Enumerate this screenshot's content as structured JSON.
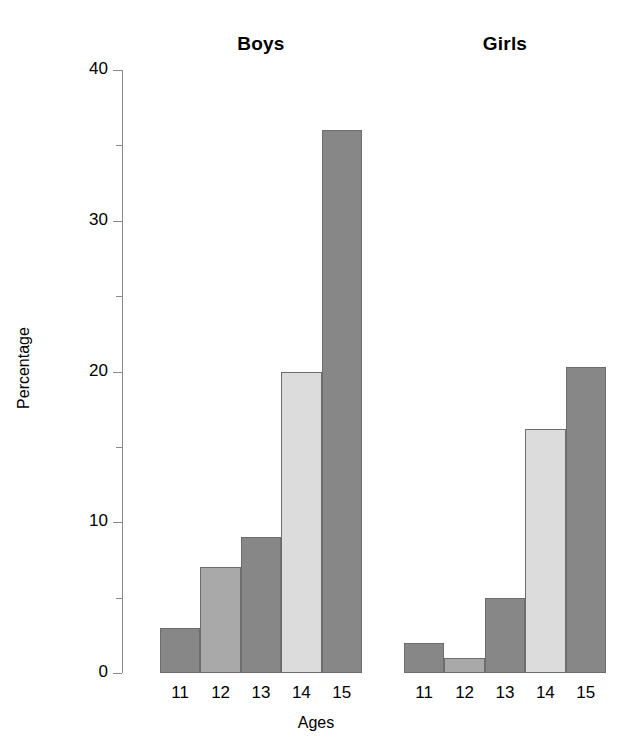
{
  "chart_data": {
    "type": "bar",
    "title": "",
    "xlabel": "Ages",
    "ylabel": "Percentage",
    "ylim": [
      0,
      40
    ],
    "yticks": [
      0,
      10,
      20,
      30,
      40
    ],
    "yticks_minor": [
      5,
      15,
      25,
      35
    ],
    "grid": false,
    "legend": "none",
    "panels": [
      {
        "name": "Boys",
        "categories": [
          "11",
          "12",
          "13",
          "14",
          "15"
        ],
        "values": [
          3,
          7,
          9,
          20,
          36
        ],
        "colors": [
          "#878787",
          "#a9a9a9",
          "#878787",
          "#dcdcdc",
          "#878787"
        ]
      },
      {
        "name": "Girls",
        "categories": [
          "11",
          "12",
          "13",
          "14",
          "15"
        ],
        "values": [
          2,
          1,
          5,
          16.2,
          20.3
        ],
        "colors": [
          "#878787",
          "#a9a9a9",
          "#878787",
          "#dcdcdc",
          "#878787"
        ]
      }
    ],
    "bar_edge_color": "#6d6d6d",
    "axis_color": "#8a8a8a",
    "background": "#ffffff"
  },
  "axis": {
    "y_label": "Percentage",
    "x_label": "Ages",
    "y_tick_labels": [
      "40",
      "30",
      "20",
      "10",
      "0"
    ]
  },
  "titles": {
    "boys": "Boys",
    "girls": "Girls"
  }
}
